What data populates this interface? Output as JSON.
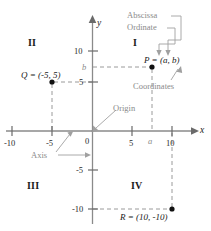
{
  "figure": {
    "kind": "cartesian-coordinate-plane-diagram",
    "colors": {
      "axis": "#8a8a8a",
      "grid_dash": "#9a9a9a",
      "annotation": "#8a8a8a",
      "point": "#111111",
      "text": "#1a1a1a"
    }
  },
  "axes": {
    "x_label": "x",
    "y_label": "y",
    "x_ticks": [
      {
        "label": "-10",
        "value": -10
      },
      {
        "label": "-5",
        "value": -5
      },
      {
        "label": "0",
        "value": 0
      },
      {
        "label": "5",
        "value": 5
      },
      {
        "label": "10",
        "value": 10
      }
    ],
    "y_ticks": [
      {
        "label": "10",
        "value": 10
      },
      {
        "label": "5",
        "value": 5
      },
      {
        "label": "-5",
        "value": -5
      },
      {
        "label": "-10",
        "value": -10
      }
    ],
    "variable_ticks": [
      {
        "label": "a",
        "axis": "x"
      },
      {
        "label": "b",
        "axis": "y"
      }
    ]
  },
  "quadrants": [
    {
      "label": "I"
    },
    {
      "label": "II"
    },
    {
      "label": "III"
    },
    {
      "label": "IV"
    }
  ],
  "points": [
    {
      "name": "P",
      "label": "P = (a, b)",
      "x": "a",
      "y": "b"
    },
    {
      "name": "Q",
      "label": "Q = (-5, 5)",
      "x": -5,
      "y": 5
    },
    {
      "name": "R",
      "label": "R = (10, -10)",
      "x": 10,
      "y": -10
    }
  ],
  "annotations": [
    {
      "label": "Abscissa",
      "points_to": "a-in-P"
    },
    {
      "label": "Ordinate",
      "points_to": "b-in-P"
    },
    {
      "label": "Coordinates",
      "points_to": "P-ordered-pair"
    },
    {
      "label": "Origin",
      "points_to": "origin-point"
    },
    {
      "label": "Axis",
      "points_to": "x-axis-and-y-axis"
    }
  ]
}
